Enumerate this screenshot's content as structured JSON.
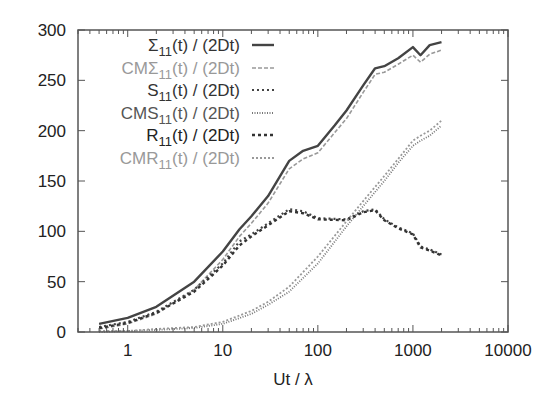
{
  "chart_data": {
    "type": "line",
    "title": "",
    "xlabel": "Ut / λ",
    "ylabel": "",
    "xscale": "log",
    "xlim": [
      0.3,
      10000
    ],
    "ylim": [
      0,
      300
    ],
    "grid": false,
    "legend_position": "top-left (inside)",
    "x_ticks": [
      "1",
      "10",
      "100",
      "1000",
      "10000"
    ],
    "y_ticks": [
      "0",
      "50",
      "100",
      "150",
      "200",
      "250",
      "300"
    ],
    "series": [
      {
        "name": "Σ₁₁(t) / (2Dt)",
        "label_main": "Σ",
        "label_prefix": "",
        "sub": "11",
        "label_suffix": "(t) / (2Dt)",
        "style": "solid",
        "color": "#444444",
        "width": 2.4,
        "dash": "",
        "x": [
          0.5,
          1,
          2,
          5,
          10,
          15,
          20,
          30,
          50,
          70,
          100,
          150,
          200,
          300,
          400,
          500,
          700,
          1000,
          1200,
          1500,
          2000
        ],
        "y": [
          8,
          14,
          25,
          50,
          80,
          102,
          115,
          135,
          170,
          180,
          185,
          205,
          220,
          245,
          262,
          264,
          272,
          283,
          275,
          285,
          288
        ]
      },
      {
        "name": "CMΣ₁₁(t) / (2Dt)",
        "label_main": "Σ",
        "label_prefix": "CM",
        "sub": "11",
        "label_suffix": "(t) / (2Dt)",
        "style": "dashed",
        "color": "#999999",
        "width": 1.6,
        "dash": "4,2",
        "x": [
          0.5,
          1,
          2,
          5,
          10,
          15,
          20,
          30,
          50,
          70,
          100,
          150,
          200,
          300,
          400,
          500,
          700,
          1000,
          1200,
          1500,
          2000
        ],
        "y": [
          3,
          8,
          18,
          42,
          72,
          95,
          108,
          128,
          162,
          172,
          178,
          198,
          212,
          238,
          256,
          258,
          266,
          275,
          268,
          276,
          280
        ]
      },
      {
        "name": "S₁₁(t) / (2Dt)",
        "label_main": "S",
        "label_prefix": "",
        "sub": "11",
        "label_suffix": "(t) / (2Dt)",
        "style": "dotted",
        "color": "#444444",
        "width": 2.2,
        "dash": "2,3",
        "x": [
          0.5,
          1,
          2,
          5,
          10,
          15,
          20,
          30,
          50,
          70,
          100,
          200,
          300,
          400,
          500,
          700,
          1000,
          1200,
          1500,
          2000
        ],
        "y": [
          5,
          10,
          20,
          42,
          68,
          90,
          97,
          108,
          122,
          120,
          113,
          112,
          120,
          122,
          112,
          104,
          98,
          85,
          82,
          77
        ]
      },
      {
        "name": "CMS₁₁(t) / (2Dt)",
        "label_main": "S",
        "label_prefix": "CM",
        "sub": "11",
        "label_suffix": "(t) / (2Dt)",
        "style": "dotted",
        "color": "#777777",
        "width": 1.8,
        "dash": "1,1.5",
        "x": [
          0.5,
          1,
          2,
          5,
          10,
          20,
          30,
          50,
          100,
          200,
          300,
          500,
          700,
          1000,
          1200,
          1500,
          2000
        ],
        "y": [
          0,
          1,
          2,
          4,
          8,
          18,
          27,
          40,
          68,
          105,
          125,
          150,
          168,
          185,
          190,
          195,
          205
        ]
      },
      {
        "name": "R₁₁(t) / (2Dt)",
        "label_main": "R",
        "label_prefix": "",
        "sub": "11",
        "label_suffix": "(t) / (2Dt)",
        "style": "dotted",
        "color": "#333333",
        "width": 2.4,
        "dash": "3,3",
        "x": [
          0.5,
          1,
          2,
          5,
          10,
          15,
          20,
          30,
          50,
          70,
          100,
          200,
          300,
          400,
          500,
          700,
          1000,
          1200,
          1500,
          2000
        ],
        "y": [
          4,
          9,
          19,
          40,
          66,
          86,
          95,
          106,
          120,
          118,
          112,
          111,
          119,
          121,
          111,
          103,
          97,
          84,
          81,
          76
        ]
      },
      {
        "name": "CMR₁₁(t) / (2Dt)",
        "label_main": "R",
        "label_prefix": "CM",
        "sub": "11",
        "label_suffix": "(t) / (2Dt)",
        "style": "dotted",
        "color": "#999999",
        "width": 1.8,
        "dash": "2,2",
        "x": [
          0.5,
          1,
          2,
          5,
          10,
          20,
          30,
          50,
          100,
          200,
          300,
          500,
          700,
          1000,
          1200,
          1500,
          2000
        ],
        "y": [
          1,
          1,
          3,
          5,
          10,
          21,
          30,
          45,
          75,
          110,
          130,
          155,
          172,
          190,
          195,
          200,
          210
        ]
      }
    ]
  },
  "legend": [
    {
      "prefix": "",
      "main": "Σ",
      "sub": "11",
      "suffix": "(t) / (2Dt)",
      "text_color": "#333333"
    },
    {
      "prefix": "CM",
      "main": "Σ",
      "sub": "11",
      "suffix": "(t) / (2Dt)",
      "text_color": "#999999"
    },
    {
      "prefix": "",
      "main": "S",
      "sub": "11",
      "suffix": "(t) / (2Dt)",
      "text_color": "#333333"
    },
    {
      "prefix": "CM",
      "main": "S",
      "sub": "11",
      "suffix": "(t) / (2Dt)",
      "text_color": "#555555"
    },
    {
      "prefix": "",
      "main": "R",
      "sub": "11",
      "suffix": "(t) / (2Dt)",
      "text_color": "#222222"
    },
    {
      "prefix": "CM",
      "main": "R",
      "sub": "11",
      "suffix": "(t) / (2Dt)",
      "text_color": "#999999"
    }
  ]
}
